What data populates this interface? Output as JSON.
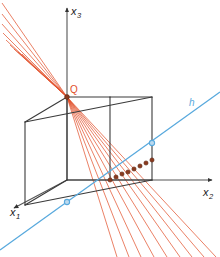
{
  "figure": {
    "background_color": "#ffffff",
    "width": 220,
    "height": 257
  },
  "axes": {
    "color": "#555555",
    "origin": {
      "x": 67,
      "y": 180
    },
    "items": [
      {
        "id": "x1",
        "name": "x-one-axis",
        "label_base": "x",
        "label_sub": "1",
        "label_x": 10,
        "label_y": 216,
        "from": {
          "x": 67,
          "y": 180
        },
        "to": {
          "x": 14,
          "y": 208
        }
      },
      {
        "id": "x2",
        "name": "x-two-axis",
        "label_base": "x",
        "label_sub": "2",
        "label_x": 203,
        "label_y": 196,
        "from": {
          "x": 67,
          "y": 180
        },
        "to": {
          "x": 212,
          "y": 180
        }
      },
      {
        "id": "x3",
        "name": "x-three-axis",
        "label_base": "x",
        "label_sub": "3",
        "label_x": 71,
        "label_y": 15,
        "from": {
          "x": 67,
          "y": 180
        },
        "to": {
          "x": 67,
          "y": 8
        }
      }
    ]
  },
  "cube": {
    "name": "unit-cube",
    "stroke_color": "#3a3a3a",
    "stroke_width": 1.1,
    "vertices": {
      "front_bottom_left": {
        "x": 67,
        "y": 180
      },
      "front_bottom_right": {
        "x": 110,
        "y": 180
      },
      "front_top_left": {
        "x": 67,
        "y": 97
      },
      "front_top_right": {
        "x": 110,
        "y": 97
      },
      "back_bottom_left": {
        "x": 25,
        "y": 205
      },
      "back_bottom_right": {
        "x": 152,
        "y": 180
      },
      "back_top_left": {
        "x": 25,
        "y": 122
      },
      "back_top_right": {
        "x": 152,
        "y": 97
      }
    }
  },
  "point_q": {
    "name": "point-q",
    "label": "Q",
    "x": 67,
    "y": 97,
    "label_x": 70,
    "label_y": 93,
    "color": "#e2502a",
    "dot_color": "#8a3a20"
  },
  "line_h": {
    "name": "line-h",
    "label": "h",
    "color": "#58a9dd",
    "stroke_width": 1.3,
    "label_x": 189,
    "label_y": 106,
    "from": {
      "x": 0,
      "y": 250
    },
    "to": {
      "x": 220,
      "y": 92
    },
    "marked_points": [
      {
        "x": 67,
        "y": 202,
        "name": "h-point-front"
      },
      {
        "x": 152,
        "y": 143,
        "name": "h-point-back"
      }
    ]
  },
  "rays": {
    "name": "projection-ray-fan",
    "color": "#e2502a",
    "stroke_width": 0.85,
    "opacity": 0.85,
    "count": 9,
    "apex": {
      "x": 67,
      "y": 97
    },
    "intersections_color": "#8b3a1e",
    "intersections": [
      {
        "x": 110,
        "y": 180
      },
      {
        "x": 116,
        "y": 177
      },
      {
        "x": 122,
        "y": 174
      },
      {
        "x": 128,
        "y": 172
      },
      {
        "x": 134,
        "y": 169
      },
      {
        "x": 140,
        "y": 166
      },
      {
        "x": 146,
        "y": 163
      },
      {
        "x": 152,
        "y": 160
      }
    ],
    "upper_endpoints": [
      {
        "x": 2,
        "y": 3
      },
      {
        "x": 2,
        "y": 14
      },
      {
        "x": 2,
        "y": 24
      },
      {
        "x": 3,
        "y": 33
      },
      {
        "x": 6,
        "y": 40
      },
      {
        "x": 10,
        "y": 45
      },
      {
        "x": 14,
        "y": 49
      },
      {
        "x": 18,
        "y": 52
      },
      {
        "x": 22,
        "y": 54
      }
    ],
    "lower_endpoints": [
      {
        "x": 117,
        "y": 257
      },
      {
        "x": 129,
        "y": 257
      },
      {
        "x": 141,
        "y": 257
      },
      {
        "x": 154,
        "y": 257
      },
      {
        "x": 167,
        "y": 257
      },
      {
        "x": 180,
        "y": 257
      },
      {
        "x": 192,
        "y": 257
      },
      {
        "x": 204,
        "y": 257
      },
      {
        "x": 216,
        "y": 257
      }
    ]
  }
}
